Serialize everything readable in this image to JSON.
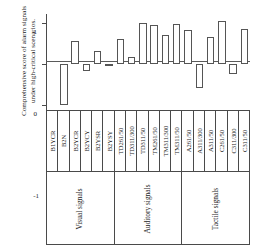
{
  "chart_data": {
    "type": "bar",
    "title": "",
    "xlabel": "",
    "ylabel": "Comprehensive score of alarm signals under high-critical scenarios.",
    "ylabel_line1": "Comprehensive score of alarm signals",
    "ylabel_line2": "under high-critical scenarios.",
    "ylim": [
      -1.12,
      1.22
    ],
    "yticks": [
      1,
      0,
      -1
    ],
    "ytick_labels": [
      "1",
      "0",
      "-1"
    ],
    "grid": false,
    "legend": null,
    "bar_fill_color": "#ffffff",
    "bar_edge_color": "#555555",
    "axis_color": "#4a4a4a",
    "categories": [
      "B1YCR",
      "B2N",
      "B2YCR",
      "B2YCY",
      "B2YSR",
      "B2YSY",
      "TD261/50",
      "TD311/300",
      "TD311/50",
      "TM261/50",
      "TM311/300",
      "TM311/50",
      "A261/50",
      "A311/300",
      "A311/50",
      "C261/50",
      "C311/300",
      "C311/50"
    ],
    "values": [
      0,
      -1.0,
      0.56,
      -0.17,
      0.31,
      -0.03,
      0.61,
      0.17,
      1.0,
      0.96,
      0.7,
      0.97,
      0.84,
      -0.58,
      0.65,
      1.05,
      -0.25,
      0.85
    ],
    "groups": [
      {
        "label": "Visual signals",
        "span": 6
      },
      {
        "label": "Auditory signals",
        "span": 6
      },
      {
        "label": "Tactile signals",
        "span": 6
      }
    ]
  }
}
